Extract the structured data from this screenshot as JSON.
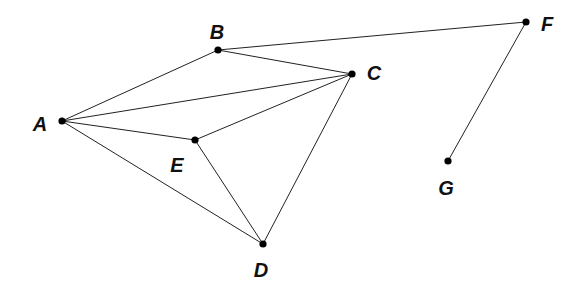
{
  "diagram": {
    "type": "graph",
    "colors": {
      "edge": "#222222",
      "node": "#000000",
      "label": "#111111",
      "background": "#ffffff"
    },
    "nodes": [
      {
        "id": "A",
        "label": "A",
        "x": 62,
        "y": 121,
        "lx": 40,
        "ly": 124
      },
      {
        "id": "B",
        "label": "B",
        "x": 218,
        "y": 50,
        "lx": 217,
        "ly": 32
      },
      {
        "id": "C",
        "label": "C",
        "x": 352,
        "y": 74,
        "lx": 374,
        "ly": 73
      },
      {
        "id": "D",
        "label": "D",
        "x": 263,
        "y": 244,
        "lx": 261,
        "ly": 270
      },
      {
        "id": "E",
        "label": "E",
        "x": 195,
        "y": 140,
        "lx": 177,
        "ly": 165
      },
      {
        "id": "F",
        "label": "F",
        "x": 526,
        "y": 22,
        "lx": 547,
        "ly": 24
      },
      {
        "id": "G",
        "label": "G",
        "x": 448,
        "y": 161,
        "lx": 446,
        "ly": 188
      }
    ],
    "edges": [
      [
        "A",
        "B"
      ],
      [
        "A",
        "C"
      ],
      [
        "A",
        "E"
      ],
      [
        "A",
        "D"
      ],
      [
        "B",
        "C"
      ],
      [
        "B",
        "F"
      ],
      [
        "C",
        "E"
      ],
      [
        "C",
        "D"
      ],
      [
        "E",
        "D"
      ],
      [
        "F",
        "G"
      ]
    ]
  }
}
